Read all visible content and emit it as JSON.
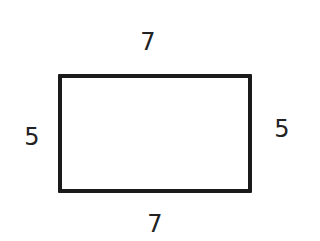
{
  "diagram": {
    "shape": "rectangle",
    "labels": {
      "top": "7",
      "bottom": "7",
      "left": "5",
      "right": "5"
    },
    "stroke_color": "#1a1a1a",
    "text_color": "#222222"
  }
}
